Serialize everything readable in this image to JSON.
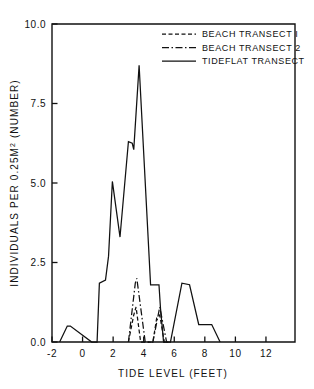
{
  "figure": {
    "background_color": "#ffffff",
    "line_color": "#111111"
  },
  "axes": {
    "x": {
      "title": "TIDE LEVEL (FEET)",
      "ticks": [
        "-2",
        "0",
        "2",
        "4",
        "6",
        "8",
        "10",
        "12"
      ],
      "tick_values": [
        -2,
        0,
        2,
        4,
        6,
        8,
        10,
        12
      ],
      "min": -2,
      "max": 13.9
    },
    "y": {
      "title_part1": "INDIVIDUALS PER 0.25M",
      "title_sup": "2",
      "title_part2": " (NUMBER)",
      "title_full": "INDIVIDUALS PER 0.25M2 (NUMBER)",
      "ticks": [
        "0.0",
        "2.5",
        "5.0",
        "7.5",
        "10.0"
      ],
      "tick_values": [
        0.0,
        2.5,
        5.0,
        7.5,
        10.0
      ],
      "min": 0,
      "max": 10
    }
  },
  "legend": {
    "position": "top-right-inside",
    "entries": [
      {
        "label": "BEACH TRANSECT I",
        "style": "dashed",
        "dash": "4,2.5"
      },
      {
        "label": "BEACH TRANSECT 2",
        "style": "dash-dot",
        "dash": "7,2.5,1.5,2.5"
      },
      {
        "label": "TIDEFLAT TRANSECT",
        "style": "solid",
        "dash": "none"
      }
    ]
  },
  "chart_data": {
    "type": "line",
    "title": "",
    "xlabel": "TIDE LEVEL (FEET)",
    "ylabel": "INDIVIDUALS PER 0.25M2 (NUMBER)",
    "xlim": [
      -2,
      13.9
    ],
    "ylim": [
      0,
      10
    ],
    "grid": false,
    "legend_position": "top-right-inside",
    "series": [
      {
        "name": "BEACH TRANSECT I",
        "style": "dashed",
        "points": [
          [
            3.0,
            0.0
          ],
          [
            3.35,
            0.85
          ],
          [
            3.5,
            1.1
          ],
          [
            3.8,
            0.0
          ],
          [
            4.1,
            0.0
          ],
          [
            4.6,
            0.0
          ],
          [
            4.85,
            0.75
          ],
          [
            5.05,
            0.85
          ],
          [
            5.35,
            0.0
          ],
          [
            5.6,
            0.0
          ]
        ]
      },
      {
        "name": "BEACH TRANSECT 2",
        "style": "dash-dot",
        "points": [
          [
            3.0,
            0.0
          ],
          [
            3.45,
            1.85
          ],
          [
            3.55,
            2.0
          ],
          [
            4.1,
            0.0
          ],
          [
            4.45,
            0.0
          ],
          [
            4.6,
            0.0
          ],
          [
            5.05,
            1.1
          ],
          [
            5.5,
            0.0
          ],
          [
            5.6,
            0.0
          ]
        ]
      },
      {
        "name": "TIDEFLAT TRANSECT",
        "style": "solid",
        "points": [
          [
            -1.5,
            0.0
          ],
          [
            -1.0,
            0.5
          ],
          [
            -0.8,
            0.5
          ],
          [
            0.6,
            0.0
          ],
          [
            0.95,
            0.0
          ],
          [
            1.1,
            1.85
          ],
          [
            1.5,
            1.95
          ],
          [
            1.7,
            2.7
          ],
          [
            1.95,
            5.05
          ],
          [
            2.45,
            3.3
          ],
          [
            3.0,
            6.3
          ],
          [
            3.25,
            6.25
          ],
          [
            3.35,
            6.05
          ],
          [
            3.7,
            8.7
          ],
          [
            4.45,
            1.8
          ],
          [
            5.0,
            1.8
          ],
          [
            5.1,
            1.05
          ],
          [
            5.3,
            0.0
          ],
          [
            5.75,
            0.0
          ],
          [
            6.5,
            1.85
          ],
          [
            7.0,
            1.8
          ],
          [
            7.6,
            0.55
          ],
          [
            8.45,
            0.55
          ],
          [
            9.0,
            0.0
          ],
          [
            9.0,
            0.0
          ]
        ]
      }
    ]
  }
}
